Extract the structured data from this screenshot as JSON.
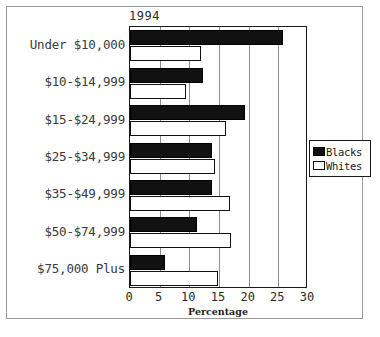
{
  "chart_data": {
    "type": "bar",
    "orientation": "horizontal",
    "title": "1994",
    "xlabel": "Percentage",
    "ylabel": "",
    "xlim": [
      0,
      30
    ],
    "xticks": [
      0,
      5,
      10,
      15,
      20,
      25,
      30
    ],
    "xtick_labels": [
      "0",
      "5",
      "10",
      "15",
      "20",
      "25",
      "30"
    ],
    "grid": true,
    "grid_axis": "x",
    "legend_position": "right",
    "categories": [
      "Under $10,000",
      "$10-$14,999",
      "$15-$24,999",
      "$25-$34,999",
      "$35-$49,999",
      "$50-$74,999",
      "$75,000 Plus"
    ],
    "series": [
      {
        "name": "Blacks",
        "color": "#111111",
        "values": [
          25.8,
          12.3,
          19.3,
          13.8,
          13.8,
          11.3,
          5.9
        ]
      },
      {
        "name": "Whites",
        "color": "#ffffff",
        "values": [
          12.0,
          9.5,
          16.2,
          14.4,
          16.8,
          17.0,
          14.9
        ]
      }
    ]
  },
  "legend": {
    "entries": [
      {
        "label": "Blacks",
        "swatch": "blacks"
      },
      {
        "label": "Whites",
        "swatch": "whites"
      }
    ]
  }
}
